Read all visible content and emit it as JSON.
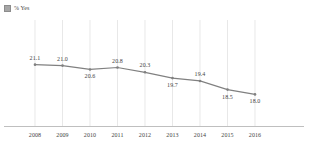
{
  "legend": {
    "swatch_color": "#a6a6a6",
    "label": "% Yes"
  },
  "chart_data": {
    "type": "line",
    "title": "",
    "subtitle": "",
    "xlabel": "",
    "ylabel": "",
    "categories": [
      "2008",
      "2009",
      "2010",
      "2011",
      "2012",
      "2013",
      "2014",
      "2015",
      "2016"
    ],
    "series": [
      {
        "name": "% Yes",
        "color": "#808080",
        "values": [
          21.1,
          21.0,
          20.6,
          20.8,
          20.3,
          19.7,
          19.4,
          18.5,
          18.0
        ],
        "point_labels": [
          "21.1",
          "21.0",
          "20.6",
          "20.8",
          "20.3",
          "19.7",
          "19.4",
          "18.5",
          "18.0"
        ],
        "label_positions": [
          "above",
          "above",
          "below",
          "above",
          "above",
          "below",
          "above",
          "below",
          "below"
        ]
      }
    ],
    "ylim": [
      17.0,
      22.0
    ],
    "grid": "vertical",
    "legend_position": "top-left",
    "axis_line": "bottom-only"
  }
}
